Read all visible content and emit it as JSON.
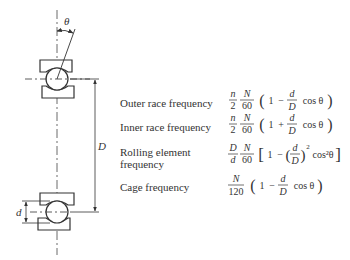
{
  "diagram": {
    "symbols": {
      "theta": "θ",
      "D": "D",
      "d": "d"
    },
    "rows": [
      {
        "label": "Outer race frequency",
        "formula": "(n/2)(N/60)(1 − (d/D) cos θ)",
        "parts": {
          "f1n": "n",
          "f1d": "2",
          "f2n": "N",
          "f2d": "60",
          "open": "(",
          "one": "1",
          "op": "−",
          "f3n": "d",
          "f3d": "D",
          "cos": "cos θ",
          "close": ")"
        }
      },
      {
        "label": "Inner race frequency",
        "formula": "(n/2)(N/60)(1 + (d/D) cos θ)",
        "parts": {
          "f1n": "n",
          "f1d": "2",
          "f2n": "N",
          "f2d": "60",
          "open": "(",
          "one": "1",
          "op": "+",
          "f3n": "d",
          "f3d": "D",
          "cos": "cos θ",
          "close": ")"
        }
      },
      {
        "label_line1": "Rolling element",
        "label_line2": "frequency",
        "formula": "(D/d)(N/60)[1 − (d/D)² cos²θ]",
        "parts": {
          "f1n": "D",
          "f1d": "d",
          "f2n": "N",
          "f2d": "60",
          "open": "[",
          "one": "1",
          "op": "−",
          "f3n": "d",
          "f3d": "D",
          "exp": "2",
          "cos": "cos²θ",
          "close": "]"
        }
      },
      {
        "label": "Cage frequency",
        "formula": "(N/120)(1 − (d/D) cos θ)",
        "parts": {
          "f2n": "N",
          "f2d": "120",
          "open": "(",
          "one": "1",
          "op": "−",
          "f3n": "d",
          "f3d": "D",
          "cos": "cos θ",
          "close": ")"
        }
      }
    ]
  }
}
